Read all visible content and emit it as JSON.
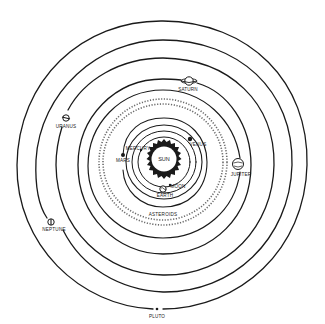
{
  "diagram": {
    "title": "",
    "background": "#ffffff",
    "ink": "#1a1a1a",
    "center": {
      "x": 163,
      "y": 162
    },
    "sun": {
      "label": "SUN",
      "radius": 18,
      "rays": 20
    },
    "labels": {
      "sun": "SUN",
      "mercury": "MERCURY",
      "venus": "VENUS",
      "earth": "EARTH",
      "moon": "MOON",
      "mars": "MARS",
      "asteroids": "ASTEROIDS",
      "jupiter": "JUPITER",
      "saturn": "SATURN",
      "uranus": "URANUS",
      "neptune": "NEPTUNE",
      "pluto": "PLUTO"
    },
    "bodies": [
      {
        "name": "Mercury",
        "orbit_radius": 26,
        "x": 141,
        "y": 150
      },
      {
        "name": "Venus",
        "orbit_radius": 31,
        "x": 191,
        "y": 139
      },
      {
        "name": "Earth",
        "orbit_radius": 37,
        "x": 164,
        "y": 188
      },
      {
        "name": "Moon",
        "orbit_radius": 37,
        "x": 170,
        "y": 185
      },
      {
        "name": "Mars",
        "orbit_radius": 44,
        "x": 123,
        "y": 155
      },
      {
        "name": "Asteroids",
        "orbit_radius": 62,
        "x": 163,
        "y": 214
      },
      {
        "name": "Jupiter",
        "orbit_radius": 78,
        "x": 238,
        "y": 165
      },
      {
        "name": "Saturn",
        "orbit_radius": 98,
        "x": 189,
        "y": 82
      },
      {
        "name": "Uranus",
        "orbit_radius": 117,
        "x": 66,
        "y": 118
      },
      {
        "name": "Neptune",
        "orbit_radius": 134,
        "x": 50,
        "y": 222
      },
      {
        "name": "Pluto",
        "orbit_radius": 147,
        "x": 158,
        "y": 309
      }
    ]
  }
}
